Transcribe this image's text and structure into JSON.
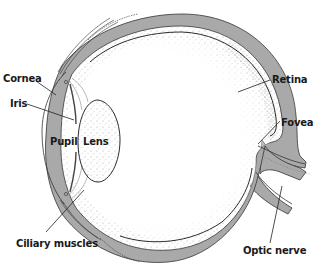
{
  "diagram": {
    "colors": {
      "background": "#ffffff",
      "sclera": "#a9a9a9",
      "outline": "#333333",
      "label": "#1a1a1a",
      "stipple": "#8a8a8a"
    },
    "labels": [
      {
        "id": "cornea",
        "text": "Cornea",
        "x": 3,
        "y": 73
      },
      {
        "id": "iris",
        "text": "Iris",
        "x": 10,
        "y": 98
      },
      {
        "id": "pupil",
        "text": "Pupil",
        "x": 50,
        "y": 136
      },
      {
        "id": "lens",
        "text": "Lens",
        "x": 83,
        "y": 136
      },
      {
        "id": "retina",
        "text": "Retina",
        "x": 272,
        "y": 74
      },
      {
        "id": "fovea",
        "text": "Fovea",
        "x": 281,
        "y": 117
      },
      {
        "id": "ciliary-muscles",
        "text": "Ciliary muscles",
        "x": 16,
        "y": 238
      },
      {
        "id": "optic-nerve",
        "text": "Optic nerve",
        "x": 243,
        "y": 245
      }
    ]
  }
}
